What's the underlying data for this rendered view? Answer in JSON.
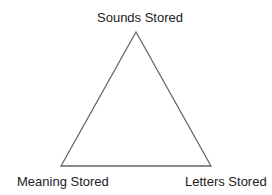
{
  "diagram": {
    "type": "triangle",
    "vertices": {
      "top": {
        "label": "Sounds Stored"
      },
      "bottom_left": {
        "label": "Meaning Stored"
      },
      "bottom_right": {
        "label": "Letters Stored"
      }
    },
    "stroke_color": "#666666"
  }
}
